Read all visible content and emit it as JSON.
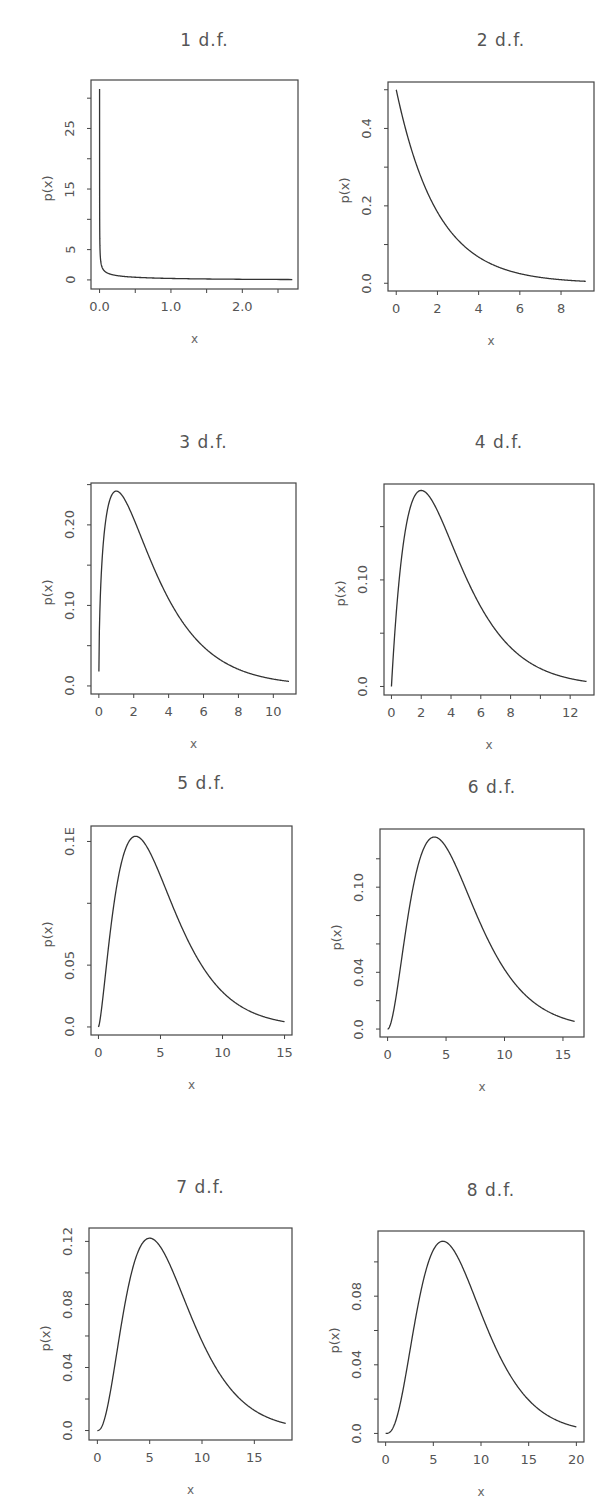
{
  "figure": {
    "line_color": "#333333",
    "frame_color": "#444444"
  },
  "chart_data": [
    {
      "type": "line",
      "title": "1 d.f.",
      "xlabel": "x",
      "ylabel": "p(x)",
      "df": 1,
      "xlim": [
        -0.12,
        2.78
      ],
      "ylim": [
        -1.5,
        33
      ],
      "x_ticks": [
        0.0,
        0.5,
        1.0,
        1.5,
        2.0,
        2.5
      ],
      "x_tick_labels": [
        {
          "v": 0.0,
          "t": "0.0"
        },
        {
          "v": 1.0,
          "t": "1.0"
        },
        {
          "v": 2.0,
          "t": "2.0"
        }
      ],
      "y_ticks": [
        0,
        5,
        10,
        15,
        20,
        25,
        30
      ],
      "y_tick_labels": [
        {
          "v": 0,
          "t": "0"
        },
        {
          "v": 5,
          "t": "5"
        },
        {
          "v": 15,
          "t": "15"
        },
        {
          "v": 25,
          "t": "25"
        }
      ],
      "x_range": [
        0.0005,
        2.7
      ],
      "ycap": 31.5,
      "grid": false,
      "legend": "none"
    },
    {
      "type": "line",
      "title": "2 d.f.",
      "xlabel": "x",
      "ylabel": "p(x)",
      "df": 2,
      "xlim": [
        -0.4,
        9.6
      ],
      "ylim": [
        -0.02,
        0.52
      ],
      "x_ticks": [
        0,
        2,
        4,
        6,
        8
      ],
      "x_tick_labels": [
        {
          "v": 0,
          "t": "0"
        },
        {
          "v": 2,
          "t": "2"
        },
        {
          "v": 4,
          "t": "4"
        },
        {
          "v": 6,
          "t": "6"
        },
        {
          "v": 8,
          "t": "8"
        }
      ],
      "y_ticks": [
        0.0,
        0.1,
        0.2,
        0.3,
        0.4,
        0.5
      ],
      "y_tick_labels": [
        {
          "v": 0.0,
          "t": "0.0"
        },
        {
          "v": 0.2,
          "t": "0.2"
        },
        {
          "v": 0.4,
          "t": "0.4"
        }
      ],
      "x_range": [
        0,
        9.2
      ],
      "grid": false,
      "legend": "none"
    },
    {
      "type": "line",
      "title": "3 d.f.",
      "xlabel": "x",
      "ylabel": "p(x)",
      "df": 3,
      "xlim": [
        -0.45,
        11.3
      ],
      "ylim": [
        -0.01,
        0.252
      ],
      "x_ticks": [
        0,
        2,
        4,
        6,
        8,
        10
      ],
      "x_tick_labels": [
        {
          "v": 0,
          "t": "0"
        },
        {
          "v": 2,
          "t": "2"
        },
        {
          "v": 4,
          "t": "4"
        },
        {
          "v": 6,
          "t": "6"
        },
        {
          "v": 8,
          "t": "8"
        },
        {
          "v": 10,
          "t": "10"
        }
      ],
      "y_ticks": [
        0.0,
        0.05,
        0.1,
        0.15,
        0.2,
        0.25
      ],
      "y_tick_labels": [
        {
          "v": 0.0,
          "t": "0.0"
        },
        {
          "v": 0.1,
          "t": "0.10"
        },
        {
          "v": 0.2,
          "t": "0.20"
        }
      ],
      "x_range": [
        0.002,
        10.9
      ],
      "grid": false,
      "legend": "none"
    },
    {
      "type": "line",
      "title": "4 d.f.",
      "xlabel": "x",
      "ylabel": "p(x)",
      "df": 4,
      "xlim": [
        -0.5,
        13.6
      ],
      "ylim": [
        -0.008,
        0.19
      ],
      "x_ticks": [
        0,
        2,
        4,
        6,
        8,
        10,
        12
      ],
      "x_tick_labels": [
        {
          "v": 0,
          "t": "0"
        },
        {
          "v": 2,
          "t": "2"
        },
        {
          "v": 4,
          "t": "4"
        },
        {
          "v": 6,
          "t": "6"
        },
        {
          "v": 8,
          "t": "8"
        },
        {
          "v": 12,
          "t": "12"
        }
      ],
      "y_ticks": [
        0.0,
        0.05,
        0.1,
        0.15
      ],
      "y_tick_labels": [
        {
          "v": 0.0,
          "t": "0.0"
        },
        {
          "v": 0.1,
          "t": "0.10"
        }
      ],
      "x_range": [
        0,
        13.1
      ],
      "grid": false,
      "legend": "none"
    },
    {
      "type": "line",
      "title": "5 d.f.",
      "xlabel": "x",
      "ylabel": "p(x)",
      "df": 5,
      "xlim": [
        -0.6,
        15.6
      ],
      "ylim": [
        -0.0065,
        0.1625
      ],
      "x_ticks": [
        0,
        5,
        10,
        15
      ],
      "x_tick_labels": [
        {
          "v": 0,
          "t": "0"
        },
        {
          "v": 5,
          "t": "5"
        },
        {
          "v": 10,
          "t": "10"
        },
        {
          "v": 15,
          "t": "15"
        }
      ],
      "y_ticks": [
        0.0,
        0.05,
        0.1,
        0.15
      ],
      "y_tick_labels": [
        {
          "v": 0.0,
          "t": "0.0"
        },
        {
          "v": 0.05,
          "t": "0.05"
        },
        {
          "v": 0.15,
          "t": "0.1Ε"
        }
      ],
      "x_range": [
        0,
        15
      ],
      "grid": false,
      "legend": "none"
    },
    {
      "type": "line",
      "title": "6 d.f.",
      "xlabel": "x",
      "ylabel": "p(x)",
      "df": 6,
      "xlim": [
        -0.65,
        16.8
      ],
      "ylim": [
        -0.0056,
        0.141
      ],
      "x_ticks": [
        0,
        5,
        10,
        15
      ],
      "x_tick_labels": [
        {
          "v": 0,
          "t": "0"
        },
        {
          "v": 5,
          "t": "5"
        },
        {
          "v": 10,
          "t": "10"
        },
        {
          "v": 15,
          "t": "15"
        }
      ],
      "y_ticks": [
        0.0,
        0.02,
        0.04,
        0.06,
        0.08,
        0.1,
        0.12
      ],
      "y_tick_labels": [
        {
          "v": 0.0,
          "t": "0.0"
        },
        {
          "v": 0.04,
          "t": "0.04"
        },
        {
          "v": 0.1,
          "t": "0.10"
        }
      ],
      "x_range": [
        0,
        16
      ],
      "grid": false,
      "legend": "none"
    },
    {
      "type": "line",
      "title": "7 d.f.",
      "xlabel": "x",
      "ylabel": "p(x)",
      "df": 7,
      "xlim": [
        -0.8,
        18.6
      ],
      "ylim": [
        -0.006,
        0.1285
      ],
      "x_ticks": [
        0,
        5,
        10,
        15
      ],
      "x_tick_labels": [
        {
          "v": 0,
          "t": "0"
        },
        {
          "v": 5,
          "t": "5"
        },
        {
          "v": 10,
          "t": "10"
        },
        {
          "v": 15,
          "t": "15"
        }
      ],
      "y_ticks": [
        0.0,
        0.02,
        0.04,
        0.06,
        0.08,
        0.1,
        0.12
      ],
      "y_tick_labels": [
        {
          "v": 0.0,
          "t": "0.0"
        },
        {
          "v": 0.04,
          "t": "0.04"
        },
        {
          "v": 0.08,
          "t": "0.08"
        },
        {
          "v": 0.12,
          "t": "0.12"
        }
      ],
      "x_range": [
        0,
        18
      ],
      "grid": false,
      "legend": "none"
    },
    {
      "type": "line",
      "title": "8 d.f.",
      "xlabel": "x",
      "ylabel": "p(x)",
      "df": 8,
      "xlim": [
        -0.8,
        20.8
      ],
      "ylim": [
        -0.005,
        0.118
      ],
      "x_ticks": [
        0,
        5,
        10,
        15,
        20
      ],
      "x_tick_labels": [
        {
          "v": 0,
          "t": "0"
        },
        {
          "v": 5,
          "t": "5"
        },
        {
          "v": 10,
          "t": "10"
        },
        {
          "v": 15,
          "t": "15"
        },
        {
          "v": 20,
          "t": "20"
        }
      ],
      "y_ticks": [
        0.0,
        0.02,
        0.04,
        0.06,
        0.08,
        0.1
      ],
      "y_tick_labels": [
        {
          "v": 0.0,
          "t": "0.0"
        },
        {
          "v": 0.04,
          "t": "0.04"
        },
        {
          "v": 0.08,
          "t": "0.08"
        }
      ],
      "x_range": [
        0,
        20
      ],
      "grid": false,
      "legend": "none"
    }
  ]
}
